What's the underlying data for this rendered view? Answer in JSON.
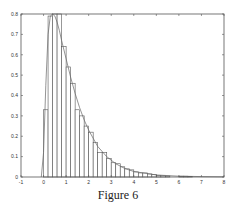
{
  "caption": "Figure 6",
  "chart_data": {
    "type": "bar",
    "subtype": "histogram with density curve overlay",
    "title": "",
    "xlabel": "",
    "ylabel": "",
    "xlim": [
      -1,
      8
    ],
    "ylim": [
      0,
      0.8
    ],
    "xticks": [
      -1,
      0,
      1,
      2,
      3,
      4,
      5,
      6,
      7,
      8
    ],
    "yticks": [
      0,
      0.1,
      0.2,
      0.3,
      0.4,
      0.5,
      0.6,
      0.7,
      0.8
    ],
    "ytick_labels": [
      "0",
      "0.1",
      "0.2",
      "0.3",
      "0.4",
      "0.5",
      "0.6",
      "0.7",
      "0.8"
    ],
    "grid": false,
    "bin_width": 0.2,
    "bins": [
      {
        "x0": 0.0,
        "x1": 0.2,
        "height": 0.33
      },
      {
        "x0": 0.2,
        "x1": 0.4,
        "height": 0.79
      },
      {
        "x0": 0.4,
        "x1": 0.6,
        "height": 0.8
      },
      {
        "x0": 0.6,
        "x1": 0.8,
        "height": 0.8
      },
      {
        "x0": 0.8,
        "x1": 1.0,
        "height": 0.64
      },
      {
        "x0": 1.0,
        "x1": 1.2,
        "height": 0.54
      },
      {
        "x0": 1.2,
        "x1": 1.4,
        "height": 0.46
      },
      {
        "x0": 1.4,
        "x1": 1.6,
        "height": 0.33
      },
      {
        "x0": 1.6,
        "x1": 1.8,
        "height": 0.3
      },
      {
        "x0": 1.8,
        "x1": 2.0,
        "height": 0.25
      },
      {
        "x0": 2.0,
        "x1": 2.2,
        "height": 0.22
      },
      {
        "x0": 2.2,
        "x1": 2.4,
        "height": 0.17
      },
      {
        "x0": 2.4,
        "x1": 2.6,
        "height": 0.12
      },
      {
        "x0": 2.6,
        "x1": 2.8,
        "height": 0.12
      },
      {
        "x0": 2.8,
        "x1": 3.0,
        "height": 0.09
      },
      {
        "x0": 3.0,
        "x1": 3.2,
        "height": 0.07
      },
      {
        "x0": 3.2,
        "x1": 3.4,
        "height": 0.065
      },
      {
        "x0": 3.4,
        "x1": 3.6,
        "height": 0.05
      },
      {
        "x0": 3.6,
        "x1": 3.8,
        "height": 0.04
      },
      {
        "x0": 3.8,
        "x1": 4.0,
        "height": 0.035
      },
      {
        "x0": 4.0,
        "x1": 4.2,
        "height": 0.025
      },
      {
        "x0": 4.2,
        "x1": 4.4,
        "height": 0.02
      },
      {
        "x0": 4.4,
        "x1": 4.6,
        "height": 0.02
      },
      {
        "x0": 4.6,
        "x1": 4.8,
        "height": 0.015
      },
      {
        "x0": 4.8,
        "x1": 5.0,
        "height": 0.012
      },
      {
        "x0": 5.0,
        "x1": 5.2,
        "height": 0.008
      },
      {
        "x0": 5.2,
        "x1": 5.4,
        "height": 0.006
      },
      {
        "x0": 5.4,
        "x1": 5.6,
        "height": 0.005
      },
      {
        "x0": 6.0,
        "x1": 6.2,
        "height": 0.004
      },
      {
        "x0": 6.2,
        "x1": 6.4,
        "height": 0.004
      },
      {
        "x0": 6.4,
        "x1": 6.6,
        "height": 0.003
      }
    ],
    "density_curve": {
      "x": [
        -0.1,
        0.0,
        0.1,
        0.2,
        0.3,
        0.4,
        0.5,
        0.6,
        0.7,
        0.8,
        1.0,
        1.2,
        1.4,
        1.6,
        1.8,
        2.0,
        2.4,
        2.8,
        3.2,
        3.6,
        4.0,
        5.0,
        6.0,
        7.0,
        8.0
      ],
      "y": [
        0.0,
        0.12,
        0.45,
        0.7,
        0.79,
        0.8,
        0.79,
        0.76,
        0.72,
        0.67,
        0.58,
        0.49,
        0.41,
        0.34,
        0.28,
        0.23,
        0.15,
        0.1,
        0.065,
        0.042,
        0.027,
        0.01,
        0.004,
        0.002,
        0.001
      ]
    },
    "colors": {
      "bar_fill": "#ffffff",
      "bar_edge": "#555555",
      "axis": "#555555",
      "curve": "#666666"
    }
  }
}
